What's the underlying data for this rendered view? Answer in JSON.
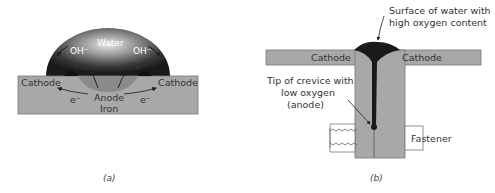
{
  "figure_a": {
    "water": "Water",
    "oh_left": "OH⁻",
    "oh_right": "OH⁻",
    "fe_left": "Fe²⁺",
    "fe_right": "Fe²⁺",
    "cathode_left": "Cathode",
    "cathode_right": "Cathode",
    "anode": "Anode",
    "iron": "Iron",
    "electron_left": "e⁻",
    "electron_right": "e⁻",
    "caption": "(a)"
  },
  "figure_b": {
    "surface_label_line1": "Surface of water with",
    "surface_label_line2": "high oxygen content",
    "cathode_left": "Cathode",
    "cathode_right": "Cathode",
    "tip_label_line1": "Tip of crevice with",
    "tip_label_line2": "low oxygen",
    "tip_label_line3": "(anode)",
    "fastener": "Fastener",
    "caption": "(b)"
  }
}
